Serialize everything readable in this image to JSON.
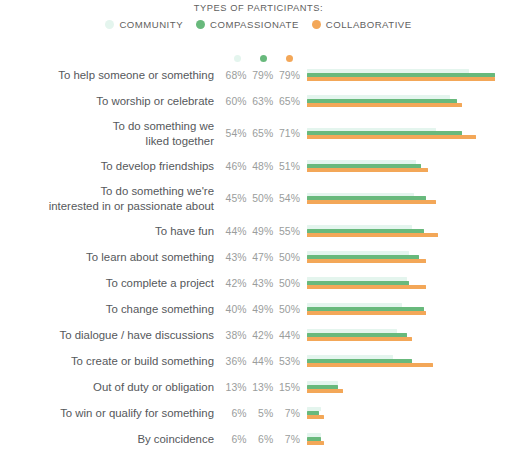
{
  "header": {
    "title": "TYPES OF PARTICIPANTS:",
    "legend": [
      {
        "label": "COMMUNITY",
        "color": "#e4f5ee"
      },
      {
        "label": "COMPASSIONATE",
        "color": "#68b97c"
      },
      {
        "label": "COLLABORATIVE",
        "color": "#f3a758"
      }
    ]
  },
  "chart_data": {
    "type": "bar",
    "orientation": "horizontal",
    "title": "TYPES OF PARTICIPANTS:",
    "xlabel": "",
    "ylabel": "",
    "xlim": [
      0,
      100
    ],
    "grid": false,
    "legend_position": "top-center",
    "value_suffix": "%",
    "categories": [
      "To help someone or something",
      "To worship or celebrate",
      "To do something we\nliked together",
      "To develop friendships",
      "To do something we're\ninterested in or passionate about",
      "To have fun",
      "To learn about something",
      "To complete a project",
      "To change something",
      "To dialogue / have discussions",
      "To create or build something",
      "Out of duty or obligation",
      "To win or qualify for something",
      "By coincidence"
    ],
    "series": [
      {
        "name": "COMMUNITY",
        "color": "#e4f5ee",
        "values": [
          68,
          60,
          54,
          46,
          45,
          44,
          43,
          42,
          40,
          38,
          36,
          13,
          6,
          6
        ],
        "labels": [
          "68%",
          "60%",
          "54%",
          "46%",
          "45%",
          "44%",
          "43%",
          "42%",
          "40%",
          "38%",
          "36%",
          "13%",
          "6%",
          "6%"
        ]
      },
      {
        "name": "COMPASSIONATE",
        "color": "#68b97c",
        "values": [
          79,
          63,
          65,
          48,
          50,
          49,
          47,
          43,
          49,
          42,
          44,
          13,
          5,
          6
        ],
        "labels": [
          "79%",
          "63%",
          "65%",
          "48%",
          "50%",
          "49%",
          "47%",
          "43%",
          "49%",
          "42%",
          "44%",
          "13%",
          "5%",
          "6%"
        ]
      },
      {
        "name": "COLLABORATIVE",
        "color": "#f3a758",
        "values": [
          79,
          65,
          71,
          51,
          54,
          55,
          50,
          50,
          50,
          44,
          53,
          15,
          7,
          7
        ],
        "labels": [
          "79%",
          "65%",
          "71%",
          "51%",
          "54%",
          "55%",
          "50%",
          "50%",
          "50%",
          "44%",
          "53%",
          "15%",
          "7%",
          "7%"
        ]
      }
    ]
  }
}
